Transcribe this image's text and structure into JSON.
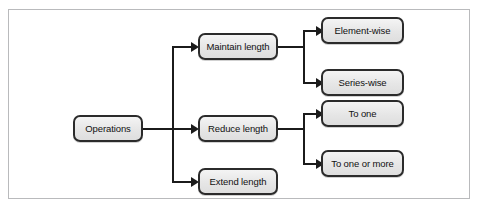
{
  "figure": {
    "caption": "",
    "frame_color": "#b9babc",
    "background": "#ffffff",
    "node_border_color": "#2b2b2b",
    "node_fill_color": "#e6e6e6",
    "connector_color": "#1b1b1b"
  },
  "diagram": {
    "type": "tree",
    "orientation": "left-to-right",
    "root": {
      "id": "operations",
      "label": "Operations"
    },
    "level2": [
      {
        "id": "maintain-length",
        "label": "Maintain length"
      },
      {
        "id": "reduce-length",
        "label": "Reduce length"
      },
      {
        "id": "extend-length",
        "label": "Extend length"
      }
    ],
    "level3": [
      {
        "id": "element-wise",
        "label": "Element-wise",
        "parent": "maintain-length"
      },
      {
        "id": "series-wise",
        "label": "Series-wise",
        "parent": "maintain-length"
      },
      {
        "id": "to-one",
        "label": "To one",
        "parent": "reduce-length"
      },
      {
        "id": "to-one-or-more",
        "label": "To one or more",
        "parent": "reduce-length"
      }
    ],
    "edges": [
      {
        "from": "operations",
        "to": "maintain-length"
      },
      {
        "from": "operations",
        "to": "reduce-length"
      },
      {
        "from": "operations",
        "to": "extend-length"
      },
      {
        "from": "maintain-length",
        "to": "element-wise"
      },
      {
        "from": "maintain-length",
        "to": "series-wise"
      },
      {
        "from": "reduce-length",
        "to": "to-one"
      },
      {
        "from": "reduce-length",
        "to": "to-one-or-more"
      }
    ]
  }
}
